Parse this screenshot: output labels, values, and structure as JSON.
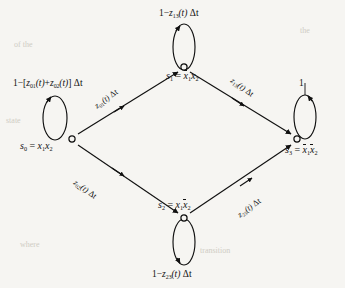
{
  "figure": {
    "type": "state-transition-diagram",
    "caption": "",
    "background_color": "#f6f5f2",
    "stroke_color": "#111111",
    "node_marker": "open-circle"
  },
  "nodes": [
    {
      "id": "s0",
      "label": "s",
      "sub": "0",
      "definition": "x₁x₂",
      "x": 72,
      "y": 139,
      "pos": "left"
    },
    {
      "id": "s1",
      "label": "s",
      "sub": "1",
      "definition": "x̄₁x₂",
      "x": 184,
      "y": 67,
      "pos": "top"
    },
    {
      "id": "s2",
      "label": "s",
      "sub": "2",
      "definition": "x₁x̄₂",
      "x": 184,
      "y": 218,
      "pos": "bottom"
    },
    {
      "id": "s3",
      "label": "s",
      "sub": "3",
      "definition": "x̄₁x̄₂",
      "x": 297,
      "y": 139,
      "pos": "right"
    }
  ],
  "node_labels": {
    "s0": {
      "state": "s",
      "state_sub": "0",
      "eq": "=",
      "def_a": "x",
      "def_a_sub": "1",
      "def_b": "x",
      "def_b_sub": "2"
    },
    "s1": {
      "state": "s",
      "state_sub": "1",
      "eq": "=",
      "def_a": "x",
      "def_a_sub": "1",
      "def_b": "x",
      "def_b_sub": "2"
    },
    "s2": {
      "state": "s",
      "state_sub": "2",
      "eq": "=",
      "def_a": "x",
      "def_a_sub": "1",
      "def_b": "x",
      "def_b_sub": "2"
    },
    "s3": {
      "state": "s",
      "state_sub": "3",
      "eq": "=",
      "def_a": "x",
      "def_a_sub": "1",
      "def_b": "x",
      "def_b_sub": "2"
    }
  },
  "edges": [
    {
      "id": "e01",
      "from": "s0",
      "to": "s1",
      "rate": "z",
      "sub": "01",
      "label_text": "z₀₁(t) Δt"
    },
    {
      "id": "e13",
      "from": "s1",
      "to": "s3",
      "rate": "z",
      "sub": "13",
      "label_text": "z₁₃(t) Δt"
    },
    {
      "id": "e02",
      "from": "s0",
      "to": "s2",
      "rate": "z",
      "sub": "02",
      "label_text": "z₀₂(t) Δt"
    },
    {
      "id": "e23",
      "from": "s2",
      "to": "s3",
      "rate": "z",
      "sub": "23",
      "label_text": "z₂₃(t) Δt"
    }
  ],
  "self_loops": [
    {
      "id": "loop_s1",
      "node": "s1",
      "position": "top",
      "label_text": "1 − z₁₃(t) Δt"
    },
    {
      "id": "loop_s0",
      "node": "s0",
      "position": "left",
      "label_text": "1 − [z₀₁(t) + z₀₂(t)] Δt"
    },
    {
      "id": "loop_s3",
      "node": "s3",
      "position": "right",
      "label_text": "1"
    },
    {
      "id": "loop_s2",
      "node": "s2",
      "position": "bottom",
      "label_text": "1 − z₂₃(t) Δt"
    }
  ],
  "loop_label_parts": {
    "top": {
      "one": "1",
      "minus": "−",
      "rate": "z",
      "sub": "13",
      "arg": "(t)",
      "dt": "Δt"
    },
    "left": {
      "one": "1",
      "minus": "−",
      "open": "[",
      "rate_a": "z",
      "sub_a": "01",
      "arg_a": "(t)",
      "plus": "+",
      "rate_b": "z",
      "sub_b": "02",
      "arg_b": "(t)",
      "close": "]",
      "dt": "Δt"
    },
    "right": {
      "one": "1"
    },
    "bottom": {
      "one": "1",
      "minus": "−",
      "rate": "z",
      "sub": "23",
      "arg": "(t)",
      "dt": "Δt"
    }
  },
  "edge_label_parts": {
    "e01": {
      "rate": "z",
      "sub": "01",
      "arg": "(t)",
      "dt": "Δt"
    },
    "e13": {
      "rate": "z",
      "sub": "13",
      "arg": "(t)",
      "dt": "Δt"
    },
    "e02": {
      "rate": "z",
      "sub": "02",
      "arg": "(t)",
      "dt": "Δt"
    },
    "e23": {
      "rate": "z",
      "sub": "23",
      "arg": "(t)",
      "dt": "Δt"
    }
  },
  "background_bleed": [
    {
      "text": "of the",
      "x": 14,
      "y": 44,
      "size": 8
    },
    {
      "text": "the",
      "x": 300,
      "y": 30,
      "size": 8
    },
    {
      "text": "state",
      "x": 6,
      "y": 120,
      "size": 8
    },
    {
      "text": "transition",
      "x": 200,
      "y": 250,
      "size": 8
    },
    {
      "text": "where",
      "x": 20,
      "y": 244,
      "size": 8
    }
  ]
}
